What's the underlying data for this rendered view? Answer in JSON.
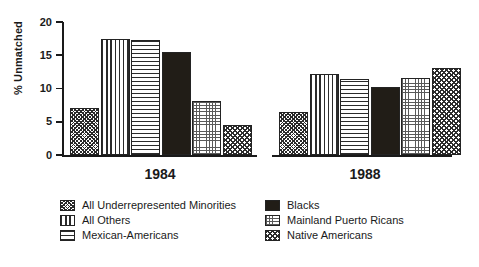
{
  "chart_data": {
    "type": "bar",
    "title": "",
    "subtitle": "",
    "xlabel": "",
    "ylabel": "% Unmatched",
    "ylim": [
      0,
      20
    ],
    "yticks": [
      0,
      5,
      10,
      15,
      20
    ],
    "ytick_labels": [
      "0",
      "5",
      "10",
      "15",
      "20"
    ],
    "grid": false,
    "legend_position": "bottom",
    "categories": [
      "1984",
      "1988"
    ],
    "series": [
      {
        "name": "All Underrepresented Minorities",
        "values": [
          7.0,
          6.5
        ]
      },
      {
        "name": "All Others",
        "values": [
          17.5,
          12.2
        ]
      },
      {
        "name": "Mexican-Americans",
        "values": [
          17.3,
          11.5
        ]
      },
      {
        "name": "Blacks",
        "values": [
          15.5,
          10.3
        ]
      },
      {
        "name": "Mainland Puerto Ricans",
        "values": [
          8.1,
          11.6
        ]
      },
      {
        "name": "Native Americans",
        "values": [
          4.5,
          13.1
        ]
      }
    ]
  },
  "axis": {
    "y_title": "% Unmatched",
    "ticks": [
      {
        "label": "20",
        "value": 20
      },
      {
        "label": "15",
        "value": 15
      },
      {
        "label": "10",
        "value": 10
      },
      {
        "label": "5",
        "value": 5
      },
      {
        "label": "0",
        "value": 0
      }
    ]
  },
  "groups": [
    {
      "label": "1984"
    },
    {
      "label": "1988"
    }
  ],
  "legend": {
    "left_column": [
      {
        "label": "All Underrepresented Minorities",
        "pattern": "diagonal-crosshatch-swatch",
        "fill_class": "fill-underrep"
      },
      {
        "label": "All Others",
        "pattern": "vertical-lines-swatch",
        "fill_class": "fill-others"
      },
      {
        "label": "Mexican-Americans",
        "pattern": "horizontal-lines-swatch",
        "fill_class": "fill-mexam"
      }
    ],
    "right_column": [
      {
        "label": "Blacks",
        "pattern": "solid-black-swatch",
        "fill_class": "fill-blacks"
      },
      {
        "label": "Mainland Puerto Ricans",
        "pattern": "dotted-grid-swatch",
        "fill_class": "fill-mpr"
      },
      {
        "label": "Native Americans",
        "pattern": "diagonal-hatch-swatch",
        "fill_class": "fill-native"
      }
    ]
  },
  "colors": {
    "ink": "#1a1a1a",
    "bar_outline": "#232323",
    "solid_fill": "#211d17",
    "background": "#ffffff"
  }
}
